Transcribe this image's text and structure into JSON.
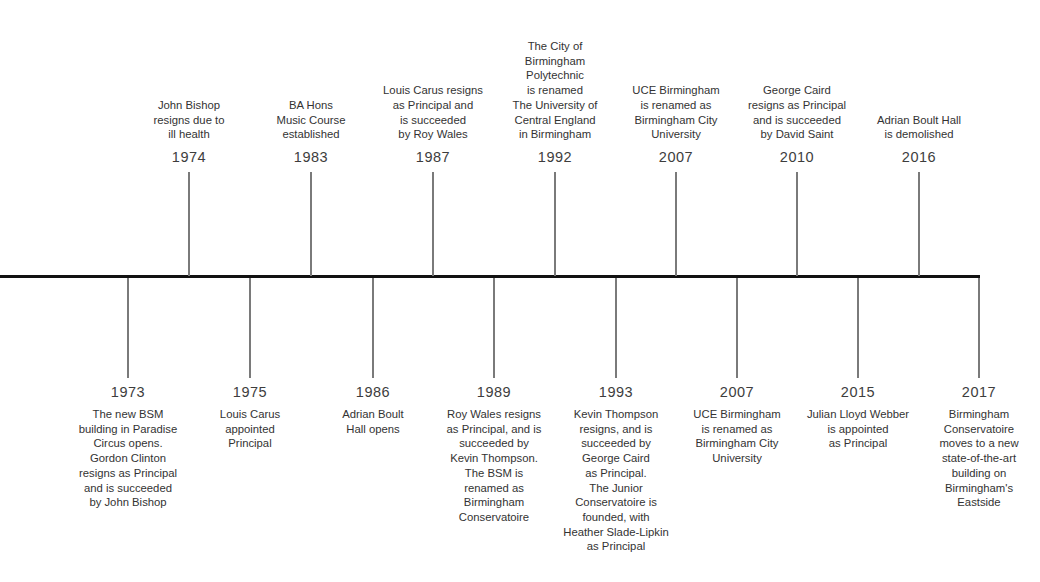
{
  "chart_data": {
    "type": "timeline",
    "title": "",
    "axis": {
      "x_start": 0,
      "x_end": 980,
      "y": 276,
      "color": "#111111"
    },
    "stem_color": "#7a7a7a",
    "events_above": [
      {
        "year": "1974",
        "x": 189,
        "text": "John Bishop\nresigns due to\nill health"
      },
      {
        "year": "1983",
        "x": 311,
        "text": "BA Hons\nMusic Course\nestablished"
      },
      {
        "year": "1987",
        "x": 433,
        "text": "Louis Carus resigns\nas Principal and\nis succeeded\nby Roy Wales"
      },
      {
        "year": "1992",
        "x": 555,
        "text": "The City of\nBirmingham\nPolytechnic\nis renamed\nThe University of\nCentral England\nin Birmingham"
      },
      {
        "year": "2007",
        "x": 676,
        "text": "UCE Birmingham\nis renamed as\nBirmingham City\nUniversity"
      },
      {
        "year": "2010",
        "x": 797,
        "text": "George Caird\nresigns as Principal\nand is succeeded\nby David Saint"
      },
      {
        "year": "2016",
        "x": 919,
        "text": "Adrian Boult Hall\nis demolished"
      }
    ],
    "events_below": [
      {
        "year": "1973",
        "x": 128,
        "text": "The new BSM\nbuilding in Paradise\nCircus opens.\nGordon Clinton\nresigns as Principal\nand is succeeded\nby John Bishop"
      },
      {
        "year": "1975",
        "x": 250,
        "text": "Louis Carus\nappointed\nPrincipal"
      },
      {
        "year": "1986",
        "x": 373,
        "text": "Adrian Boult\nHall opens"
      },
      {
        "year": "1989",
        "x": 494,
        "text": "Roy Wales resigns\nas Principal, and is\nsucceeded by\nKevin Thompson.\nThe BSM is\nrenamed as\nBirmingham\nConservatoire"
      },
      {
        "year": "1993",
        "x": 616,
        "text": "Kevin Thompson\nresigns, and is\nsucceeded by\nGeorge Caird\nas Principal.\nThe Junior\nConservatoire is\nfounded, with\nHeather Slade-Lipkin\nas Principal"
      },
      {
        "year": "2007",
        "x": 737,
        "text": "UCE Birmingham\nis renamed as\nBirmingham City\nUniversity"
      },
      {
        "year": "2015",
        "x": 858,
        "text": "Julian Lloyd Webber\nis appointed\nas Principal"
      },
      {
        "year": "2017",
        "x": 979,
        "text": "Birmingham\nConservatoire\nmoves to a new\nstate-of-the-art\nbuilding on\nBirmingham's\nEastside"
      }
    ]
  }
}
